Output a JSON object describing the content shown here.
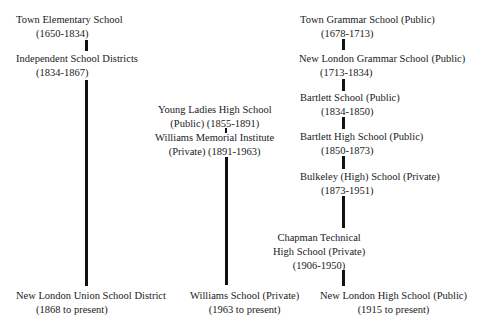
{
  "diagram": {
    "type": "timeline-lineage",
    "columns": [
      {
        "name": "elementary",
        "nodes": [
          {
            "name": "Town Elementary School",
            "dates": "(1650-1834)"
          },
          {
            "name": "Independent School Districts",
            "dates": "(1834-1867)"
          },
          {
            "name": "New London Union School District",
            "dates": "(1868 to present)"
          }
        ]
      },
      {
        "name": "williams",
        "nodes": [
          {
            "name": "Young Ladies High School",
            "dates": "(Public) (1855-1891)"
          },
          {
            "name": "Williams Memorial Institute",
            "dates": "(Private) (1891-1963)"
          },
          {
            "name": "Williams School (Private)",
            "dates": "(1963 to present)"
          }
        ]
      },
      {
        "name": "high-school",
        "nodes": [
          {
            "name": "Town Grammar School (Public)",
            "dates": "(1678-1713)"
          },
          {
            "name": "New London Grammar School (Public)",
            "dates": "(1713-1834)"
          },
          {
            "name": "Bartlett School (Public)",
            "dates": "(1834-1850)"
          },
          {
            "name": "Bartlett High School (Public)",
            "dates": "(1850-1873)"
          },
          {
            "name": "Bulkeley (High) School (Private)",
            "dates": "(1873-1951)"
          },
          {
            "name": "Chapman Technical",
            "line2": "High School (Private)",
            "dates": "(1906-1950)"
          },
          {
            "name": "New London High School (Public)",
            "dates": "(1915 to present)"
          }
        ]
      }
    ]
  }
}
